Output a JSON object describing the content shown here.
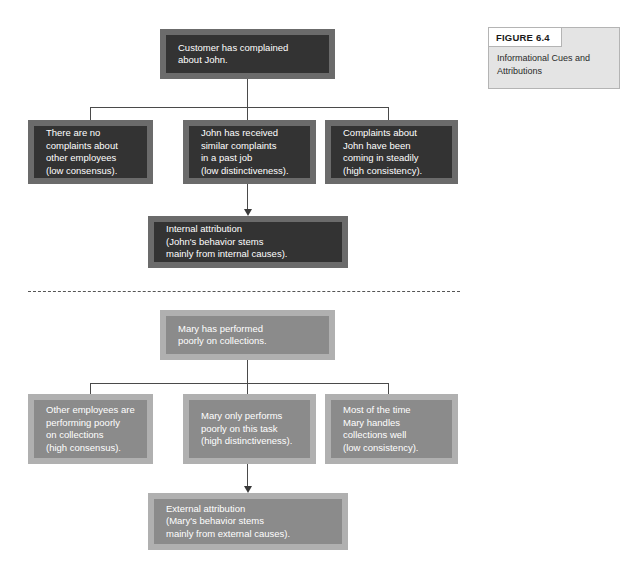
{
  "figure": {
    "tab_label": "FIGURE 6.4",
    "caption": "Informational Cues and Attributions"
  },
  "diagram": {
    "title": "Informational Cues and Attributions",
    "type": "two-scenario attribution flow chart",
    "scenarios": [
      {
        "id": "john",
        "style": "dark",
        "event": "Customer has complained\nabout John.",
        "cues": [
          "There are no\ncomplaints about\nother employees\n(low consensus).",
          "John has received\nsimilar complaints\nin a past job\n(low distinctiveness).",
          "Complaints about\nJohn have been\ncoming in steadily\n(high consistency)."
        ],
        "conclusion": "Internal attribution\n(John's behavior stems\nmainly from internal causes)."
      },
      {
        "id": "mary",
        "style": "mid",
        "event": "Mary has performed\npoorly on collections.",
        "cues": [
          "Other employees are\nperforming poorly\non collections\n(high consensus).",
          "Mary only performs\npoorly on this task\n(high distinctiveness).",
          "Most of the time\nMary handles\ncollections well\n(low consistency)."
        ],
        "conclusion": "External attribution\n(Mary's behavior stems\nmainly from external causes)."
      }
    ],
    "colors": {
      "dark_outer": "#6b6b6b",
      "dark_inner": "#333333",
      "mid_outer": "#b0b0b0",
      "mid_inner": "#8b8b8b",
      "connector": "#4a4a4a",
      "divider": "#555555",
      "text": "#ffffff",
      "figure_box_bg": "#e4e4e4",
      "figure_tab_bg": "#ffffff"
    }
  }
}
